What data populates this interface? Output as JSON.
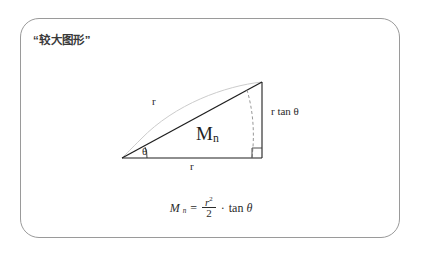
{
  "card": {
    "title": "“较大图形”",
    "border_color": "#9a9a9a",
    "background": "#ffffff"
  },
  "diagram": {
    "type": "geometry-figure",
    "colors": {
      "triangle_stroke": "#1f1f1f",
      "arc_stroke": "#c8c8c8",
      "dashed_arc_stroke": "#8c8c8c",
      "text": "#2b2b2b"
    },
    "vertices": {
      "left": [
        122,
        158
      ],
      "right_angle": [
        262,
        158
      ],
      "apex": [
        262,
        82
      ]
    },
    "labels": {
      "hypotenuse_r": "r",
      "base_r": "r",
      "angle_theta": "θ",
      "opposite_side": "r tan θ",
      "region": "M",
      "region_subscript": "n"
    },
    "markers": {
      "right_angle": true,
      "angle_arc": true
    }
  },
  "formula": {
    "lhs_var": "M",
    "lhs_sub": "n",
    "equals": "=",
    "numerator": "r",
    "numerator_exponent": "2",
    "denominator": "2",
    "multiply": "·",
    "trig": "tan",
    "trig_arg": "θ",
    "plain": "M_n = r² / 2 · tan θ"
  }
}
